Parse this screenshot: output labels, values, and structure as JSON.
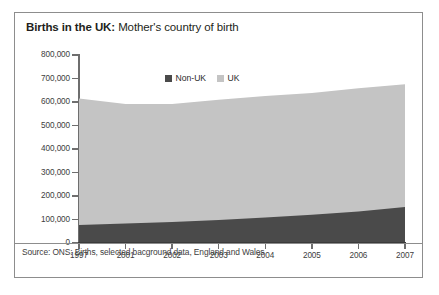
{
  "title": {
    "strong": "Births in the UK:",
    "rest": " Mother's country of birth"
  },
  "source": {
    "text": "Source: ONS: Births, selected bacground data, England and Wales"
  },
  "colors": {
    "non_uk": "#4a4a4a",
    "uk": "#c4c4c4",
    "axis": "#6e6e6e",
    "frame": "#8d8d8d",
    "text": "#231f20"
  },
  "chart_data": {
    "type": "area",
    "stacked": true,
    "title": "Births in the UK: Mother's country of birth",
    "xlabel": "",
    "ylabel": "",
    "categories": [
      "1997",
      "2001",
      "2002",
      "2003",
      "2004",
      "2005",
      "2006",
      "2007"
    ],
    "series": [
      {
        "name": "Non-UK",
        "color": "#4a4a4a",
        "values": [
          77000,
          83000,
          89000,
          98000,
          108000,
          120000,
          134000,
          153000
        ]
      },
      {
        "name": "UK",
        "color": "#c4c4c4",
        "values": [
          538000,
          508000,
          502000,
          512000,
          518000,
          518000,
          524000,
          523000
        ]
      }
    ],
    "totals": [
      615000,
      591000,
      591000,
      610000,
      626000,
      638000,
      658000,
      676000
    ],
    "ylim": [
      0,
      800000
    ],
    "yticks": [
      0,
      100000,
      200000,
      300000,
      400000,
      500000,
      600000,
      700000,
      800000
    ],
    "ytick_labels": [
      "0",
      "100,000",
      "200,000",
      "300,000",
      "400,000",
      "500,000",
      "600,000",
      "700,000",
      "800,000"
    ],
    "grid": false,
    "legend": {
      "position": "top-center",
      "entries": [
        {
          "label": "Non-UK",
          "color": "#4a4a4a"
        },
        {
          "label": "UK",
          "color": "#c4c4c4"
        }
      ]
    }
  }
}
